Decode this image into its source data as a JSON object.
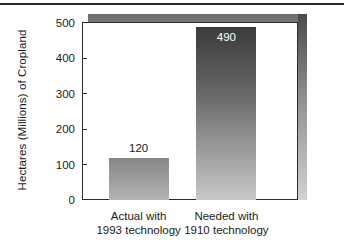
{
  "chart_data": {
    "type": "bar",
    "title": "",
    "subtitle": "",
    "xlabel": "",
    "ylabel": "Hectares (Millions) of Cropland",
    "categories": [
      "Actual with 1993 technology",
      "Needed with 1910 technology"
    ],
    "category_lines": [
      [
        "Actual with",
        "1993 technology"
      ],
      [
        "Needed with",
        "1910 technology"
      ]
    ],
    "values": [
      120,
      490
    ],
    "value_labels": [
      "120",
      "490"
    ],
    "ylim": [
      0,
      500
    ],
    "yticks": [
      0,
      100,
      200,
      300,
      400,
      500
    ],
    "ytick_labels": [
      "0",
      "100",
      "200",
      "300",
      "400",
      "500"
    ],
    "grid": false,
    "legend": false,
    "legend_position": "none",
    "bar_style": "vertical-gradient-fill",
    "colors": {
      "bar_1_top": "#868686",
      "bar_1_bottom": "#b4b4b4",
      "bar_2_top": "#3b3b3b",
      "bar_2_bottom": "#c9c9c9",
      "axis": "#2b2b2b",
      "text": "#1a1a1a",
      "value_label_inside": "#ffffff",
      "background": "#ffffff",
      "shadow": "#6d6d6d"
    }
  }
}
